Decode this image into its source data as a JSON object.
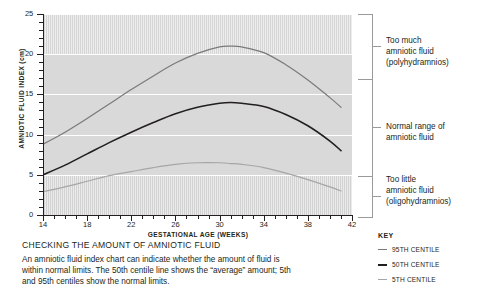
{
  "chart_data": {
    "type": "line",
    "xlabel": "GESTATIONAL AGE (WEEKS)",
    "ylabel": "AMNIOTIC FLUID INDEX (cm)",
    "xlim": [
      14,
      42
    ],
    "ylim": [
      0,
      25
    ],
    "xticks": [
      14,
      18,
      22,
      26,
      30,
      34,
      38,
      42
    ],
    "yticks": [
      0,
      5,
      10,
      15,
      20,
      25
    ],
    "xtick_step_minor": 1,
    "ytick_step_minor": 1,
    "grid": "horizontal-white-gridlines-at-major-yticks",
    "legend_position": "bottom-right",
    "x": [
      14,
      16,
      18,
      20,
      22,
      24,
      26,
      28,
      30,
      31,
      32,
      34,
      36,
      38,
      40,
      41
    ],
    "series": [
      {
        "name": "95TH CENTILE",
        "color": "#7a7a7a",
        "values": [
          8.8,
          10.3,
          12.0,
          13.8,
          15.6,
          17.3,
          18.9,
          20.1,
          20.9,
          21.0,
          20.9,
          20.2,
          18.7,
          16.8,
          14.6,
          13.4
        ]
      },
      {
        "name": "50TH CENTILE",
        "color": "#231f20",
        "values": [
          5.0,
          6.2,
          7.6,
          9.0,
          10.3,
          11.5,
          12.6,
          13.4,
          13.9,
          14.0,
          13.9,
          13.5,
          12.5,
          11.1,
          9.2,
          8.0
        ]
      },
      {
        "name": "5TH CENTILE",
        "color": "#a6a6a6",
        "values": [
          2.9,
          3.5,
          4.2,
          4.9,
          5.4,
          5.9,
          6.3,
          6.5,
          6.5,
          6.4,
          6.3,
          5.9,
          5.2,
          4.4,
          3.5,
          3.0
        ]
      }
    ],
    "bands": [
      {
        "name": "polyhydramnios-band",
        "from": 20,
        "to": 25,
        "hatched": true
      },
      {
        "name": "normal-band",
        "from": 5,
        "to": 20,
        "hatched": false
      },
      {
        "name": "oligohydramnios-band",
        "from": 0,
        "to": 5,
        "hatched": true
      }
    ]
  },
  "annotations": [
    {
      "id": "too-much",
      "lines": [
        "Too much",
        "amniotic fluid",
        "(polyhydramnios)"
      ]
    },
    {
      "id": "normal",
      "lines": [
        "Normal range of",
        "amniotic fluid"
      ]
    },
    {
      "id": "too-little",
      "lines": [
        "Too little",
        "amniotic fluid",
        "(oligohydramnios)"
      ]
    }
  ],
  "key": {
    "title": "KEY",
    "items": [
      {
        "label": "95TH CENTILE",
        "color": "#7a7a7a",
        "thickness": "1.3px"
      },
      {
        "label": "50TH CENTILE",
        "color": "#231f20",
        "thickness": "2px"
      },
      {
        "label": "5TH CENTILE",
        "color": "#a6a6a6",
        "thickness": "1.2px"
      }
    ]
  },
  "caption": {
    "title": "CHECKING THE AMOUNT OF AMNIOTIC FLUID",
    "body": "An amniotic fluid index chart can indicate whether the amount of fluid is within normal limits. The 50th centile line shows the “average” amount; 5th and 95th centiles show the normal limits."
  }
}
